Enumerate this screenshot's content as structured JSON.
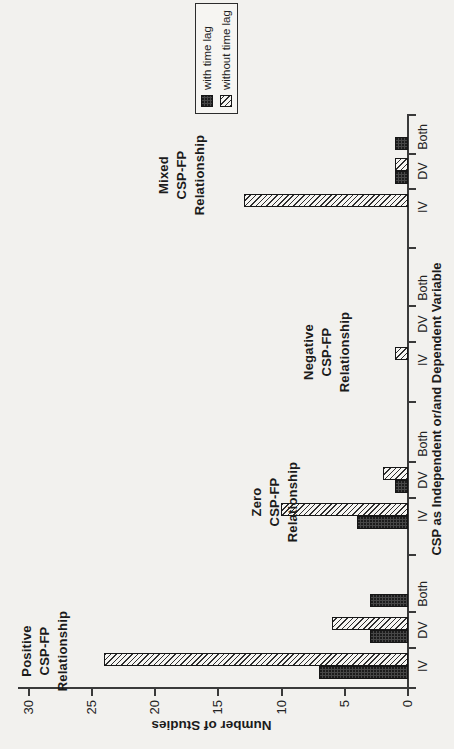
{
  "figure": {
    "colors": {
      "paper": "#f2f1ee",
      "ink": "#232323",
      "axis": "#3a3a3a",
      "bar_with_time_lag_fill": "#474747",
      "bar_without_time_lag_hatch": "#2e2e2e",
      "bar_border": "#161616"
    }
  },
  "chart_data": {
    "type": "bar",
    "title": "",
    "xlabel": "CSP as Independent or/and Dependent Variable",
    "ylabel": "Number of Studies",
    "ylim": [
      0,
      30
    ],
    "yticks": [
      30,
      25,
      20,
      15,
      10,
      5,
      0
    ],
    "grid": "off",
    "legend_position": "right-middle",
    "rotation_on_page": "90deg counterclockwise",
    "categories": [
      "IV",
      "DV",
      "Both"
    ],
    "groups": [
      {
        "title": "Positive CSP-FP Relationship",
        "title_lines": [
          "Positive",
          "CSP-FP",
          "Relationship"
        ]
      },
      {
        "title": "Zero CSP-FP Relationship",
        "title_lines": [
          "Zero",
          "CSP-FP",
          "Relationship"
        ]
      },
      {
        "title": "Negative CSP-FP Relationship",
        "title_lines": [
          "Negative",
          "CSP-FP",
          "Relationship"
        ]
      },
      {
        "title": "Mixed CSP-FP Relationship",
        "title_lines": [
          "Mixed",
          "CSP-FP",
          "Relationship"
        ]
      }
    ],
    "series": [
      {
        "name": "with time lag",
        "swatch": "solid-dark",
        "values_by_group": [
          [
            7,
            3,
            3
          ],
          [
            4,
            1,
            0
          ],
          [
            0,
            0,
            0
          ],
          [
            0,
            1,
            1
          ]
        ]
      },
      {
        "name": "without time lag",
        "swatch": "hatched",
        "values_by_group": [
          [
            24,
            6,
            0
          ],
          [
            10,
            2,
            0
          ],
          [
            1,
            0,
            0
          ],
          [
            13,
            1,
            0
          ]
        ]
      }
    ]
  }
}
